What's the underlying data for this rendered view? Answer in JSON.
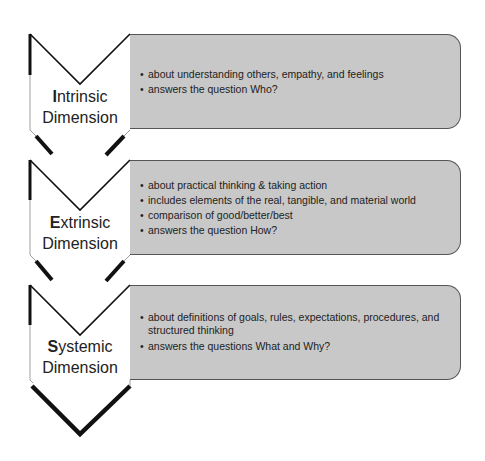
{
  "diagram": {
    "type": "vertical chevron list",
    "steps": [
      {
        "initial": "I",
        "title_rest": "ntrinsic",
        "subtitle": "Dimension",
        "bullets": [
          "about understanding others, empathy, and feelings",
          "answers the question Who?"
        ]
      },
      {
        "initial": "E",
        "title_rest": "xtrinsic",
        "subtitle": "Dimension",
        "bullets": [
          "about practical thinking & taking action",
          "includes elements of the real, tangible, and material world",
          "comparison of good/better/best",
          "answers the question How?"
        ]
      },
      {
        "initial": "S",
        "title_rest": "ystemic",
        "subtitle": "Dimension",
        "bullets": [
          "about definitions of goals, rules, expectations, procedures, and structured thinking",
          "answers the questions What and Why?"
        ]
      }
    ],
    "colors": {
      "box_fill": "#c8c8c8",
      "chevron_stroke": "#111111",
      "chevron_fill": "#ffffff",
      "text": "#222222"
    }
  }
}
